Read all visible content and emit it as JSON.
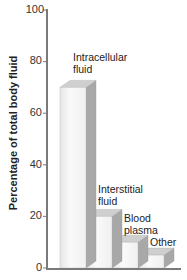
{
  "chart_data": {
    "type": "bar",
    "title": "",
    "xlabel": "",
    "ylabel": "Percentage of total body fluid",
    "ylim": [
      0,
      100
    ],
    "yticks": [
      0,
      20,
      40,
      60,
      80,
      100
    ],
    "categories": [
      "Intracellular fluid",
      "Interstitial fluid",
      "Blood plasma",
      "Other"
    ],
    "values": [
      70,
      20,
      10,
      5
    ],
    "grid": false,
    "legend": null,
    "style": "3d-bars"
  },
  "labels": {
    "ylabel": "Percentage of total body fluid",
    "ticks": [
      "0",
      "20",
      "40",
      "60",
      "80",
      "100"
    ],
    "bars": [
      {
        "line1": "Intracellular",
        "line2": "fluid"
      },
      {
        "line1": "Interstitial",
        "line2": "fluid"
      },
      {
        "line1": "Blood",
        "line2": "plasma"
      },
      {
        "line1": "Other",
        "line2": ""
      }
    ]
  },
  "colors": {
    "axis": "#7a7a7a",
    "bar_front": "#f4f4f4",
    "bar_side": "#a8a8a8",
    "bar_top": "#cfcfcf"
  }
}
